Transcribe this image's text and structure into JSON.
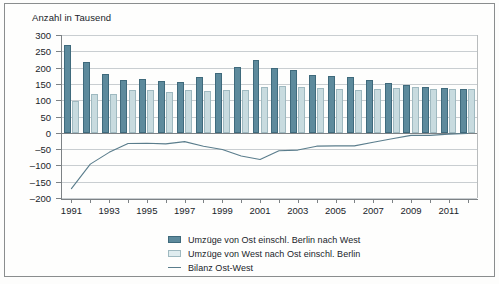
{
  "chart_data": {
    "type": "bar",
    "title": "Anzahl in Tausend",
    "xlabel": "",
    "ylabel": "Anzahl in Tausend",
    "ylim": [
      -200,
      300
    ],
    "ytick_values": [
      300,
      250,
      200,
      150,
      100,
      50,
      0,
      -50,
      -100,
      -150,
      -200
    ],
    "ytick_labels": [
      "300",
      "250",
      "200",
      "150",
      "100",
      "50",
      "0",
      "–50",
      "–100",
      "–150",
      "–200"
    ],
    "grid": true,
    "legend_position": "below",
    "categories": [
      1991,
      1992,
      1993,
      1994,
      1995,
      1996,
      1997,
      1998,
      1999,
      2000,
      2001,
      2002,
      2003,
      2004,
      2005,
      2006,
      2007,
      2008,
      2009,
      2010,
      2011,
      2012
    ],
    "xtick_labels": [
      "1991",
      "1993",
      "1995",
      "1997",
      "1999",
      "2001",
      "2003",
      "2005",
      "2007",
      "2009",
      "2011"
    ],
    "xtick_label_years": [
      1991,
      1993,
      1995,
      1997,
      1999,
      2001,
      2003,
      2005,
      2007,
      2009,
      2011
    ],
    "series": [
      {
        "name": "Umzüge von Ost einschl. Berlin nach West",
        "type": "bar",
        "color": "#5d8a9c",
        "values": [
          270,
          216,
          180,
          163,
          164,
          158,
          157,
          170,
          183,
          203,
          222,
          199,
          193,
          178,
          175,
          170,
          162,
          154,
          148,
          142,
          138,
          135
        ]
      },
      {
        "name": "Umzüge von West nach Ost einschl. Berlin",
        "type": "bar",
        "color": "#c8dbdf",
        "values": [
          99,
          120,
          120,
          130,
          132,
          124,
          130,
          129,
          132,
          132,
          140,
          144,
          140,
          137,
          135,
          130,
          133,
          136,
          140,
          134,
          134,
          133
        ]
      },
      {
        "name": "Bilanz Ost-West",
        "type": "line",
        "color": "#5a7d8c",
        "values": [
          -171,
          -96,
          -60,
          -33,
          -32,
          -34,
          -27,
          -41,
          -51,
          -71,
          -82,
          -55,
          -53,
          -41,
          -40,
          -40,
          -29,
          -18,
          -8,
          -8,
          -4,
          -2
        ]
      }
    ],
    "legend": [
      {
        "label": "Umzüge von Ost einschl. Berlin nach West",
        "swatch": "dark"
      },
      {
        "label": "Umzüge von West nach Ost einschl. Berlin",
        "swatch": "light"
      },
      {
        "label": "Bilanz Ost-West",
        "swatch": "line"
      }
    ]
  }
}
